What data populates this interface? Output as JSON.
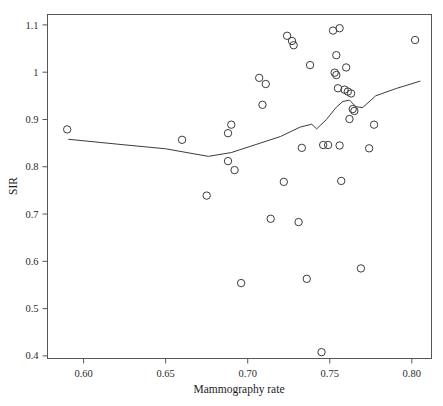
{
  "chart_data": {
    "type": "scatter",
    "title": "",
    "subtitle": "",
    "xlabel": "Mammography rate",
    "ylabel": "SIR",
    "xlim": [
      0.578,
      0.812
    ],
    "ylim": [
      0.3945,
      1.122
    ],
    "xticks": [
      0.6,
      0.65,
      0.7,
      0.75,
      0.8
    ],
    "xticklabels": [
      "0.60",
      "0.65",
      "0.70",
      "0.75",
      "0.80"
    ],
    "yticks": [
      0.4,
      0.5,
      0.6,
      0.7,
      0.8,
      0.9,
      1.0,
      1.1
    ],
    "yticklabels": [
      "0.4",
      "0.5",
      "0.6",
      "0.7",
      "0.8",
      "0.9",
      "1",
      "1.1"
    ],
    "grid": false,
    "legend": null,
    "marker": "open-circle",
    "marker_color": "#3c3c3f",
    "line_color": "#3c3c3f",
    "series": [
      {
        "name": "observations",
        "type": "scatter",
        "points": [
          [
            0.59,
            0.879
          ],
          [
            0.66,
            0.857
          ],
          [
            0.675,
            0.739
          ],
          [
            0.688,
            0.871
          ],
          [
            0.69,
            0.889
          ],
          [
            0.688,
            0.812
          ],
          [
            0.692,
            0.793
          ],
          [
            0.696,
            0.554
          ],
          [
            0.707,
            0.988
          ],
          [
            0.709,
            0.931
          ],
          [
            0.711,
            0.975
          ],
          [
            0.714,
            0.69
          ],
          [
            0.722,
            0.768
          ],
          [
            0.724,
            1.077
          ],
          [
            0.727,
            1.066
          ],
          [
            0.728,
            1.057
          ],
          [
            0.731,
            0.683
          ],
          [
            0.733,
            0.84
          ],
          [
            0.736,
            0.563
          ],
          [
            0.738,
            1.015
          ],
          [
            0.745,
            0.408
          ],
          [
            0.746,
            0.846
          ],
          [
            0.749,
            0.846
          ],
          [
            0.752,
            1.088
          ],
          [
            0.753,
            0.999
          ],
          [
            0.754,
            0.994
          ],
          [
            0.754,
            1.036
          ],
          [
            0.755,
            0.966
          ],
          [
            0.756,
            0.845
          ],
          [
            0.756,
            1.093
          ],
          [
            0.757,
            0.77
          ],
          [
            0.759,
            0.963
          ],
          [
            0.76,
            1.01
          ],
          [
            0.761,
            0.959
          ],
          [
            0.762,
            0.901
          ],
          [
            0.763,
            0.955
          ],
          [
            0.764,
            0.922
          ],
          [
            0.765,
            0.918
          ],
          [
            0.769,
            0.585
          ],
          [
            0.774,
            0.839
          ],
          [
            0.777,
            0.889
          ],
          [
            0.802,
            1.068
          ]
        ]
      },
      {
        "name": "smoothed-trend",
        "type": "line",
        "points": [
          [
            0.591,
            0.858
          ],
          [
            0.62,
            0.848
          ],
          [
            0.65,
            0.838
          ],
          [
            0.676,
            0.822
          ],
          [
            0.69,
            0.83
          ],
          [
            0.705,
            0.847
          ],
          [
            0.72,
            0.864
          ],
          [
            0.732,
            0.884
          ],
          [
            0.739,
            0.89
          ],
          [
            0.742,
            0.88
          ],
          [
            0.748,
            0.9
          ],
          [
            0.754,
            0.926
          ],
          [
            0.758,
            0.938
          ],
          [
            0.762,
            0.941
          ],
          [
            0.766,
            0.927
          ],
          [
            0.77,
            0.925
          ],
          [
            0.778,
            0.95
          ],
          [
            0.79,
            0.965
          ],
          [
            0.805,
            0.981
          ]
        ]
      }
    ]
  },
  "axes": {
    "x_title": "Mammography rate",
    "y_title": "SIR"
  }
}
